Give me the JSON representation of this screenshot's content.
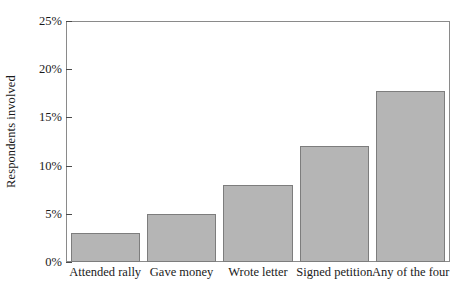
{
  "chart_data": {
    "type": "bar",
    "title": "",
    "subtitle": "",
    "xlabel": "",
    "ylabel": "Respondents involved",
    "categories": [
      "Attended rally",
      "Gave money",
      "Wrote letter",
      "Signed petition",
      "Any of the four"
    ],
    "values": [
      3.0,
      5.0,
      8.0,
      12.0,
      17.7
    ],
    "value_labels": [
      "3%",
      "5%",
      "8%",
      "12%",
      "17.7%"
    ],
    "ylim": [
      0,
      25
    ],
    "ytick_values": [
      0,
      5,
      10,
      15,
      20,
      25
    ],
    "ytick_labels": [
      "0%",
      "5%",
      "10%",
      "15%",
      "20%",
      "25%"
    ],
    "grid": false,
    "legend": false,
    "legend_position": "none",
    "series": [
      {
        "name": "Respondents involved",
        "values": [
          3.0,
          5.0,
          8.0,
          12.0,
          17.7
        ]
      }
    ],
    "colors": {
      "bar_fill": "#b5b5b5",
      "bar_edge": "#7d7d7d",
      "axis": "#8a8a8a",
      "text": "#1a1a1a",
      "background": "#ffffff"
    }
  }
}
